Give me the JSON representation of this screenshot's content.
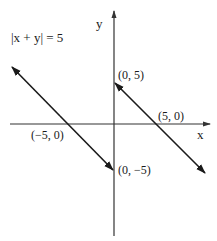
{
  "title": "|x + y| = 5",
  "axes": {
    "x_label": "x",
    "y_label": "y"
  },
  "points": {
    "y_intercept_pos": "(0, 5)",
    "x_intercept_pos": "(5, 0)",
    "x_intercept_neg": "(−5, 0)",
    "y_intercept_neg": "(0, −5)"
  },
  "lines": [
    {
      "equation": "x + y = 5",
      "through": [
        "(0, 5)",
        "(5, 0)"
      ]
    },
    {
      "equation": "x + y = -5",
      "through": [
        "(-5, 0)",
        "(0, -5)"
      ]
    }
  ],
  "colors": {
    "ink": "#1a1a1a",
    "axis": "#333333",
    "background": "#ffffff"
  }
}
